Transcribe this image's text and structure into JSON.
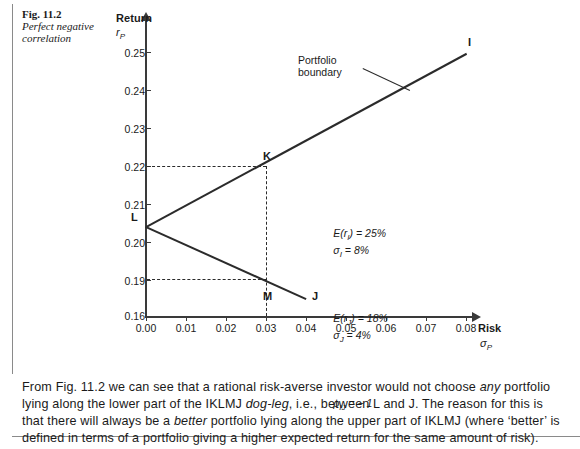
{
  "figure": {
    "number": "Fig. 11.2",
    "title": "Perfect negative correlation"
  },
  "chart_data": {
    "type": "line",
    "title": "",
    "xlabel": "Risk",
    "xlabel_sub": "σP",
    "ylabel": "Return",
    "ylabel_sub": "rP",
    "xlim": [
      0.0,
      0.08
    ],
    "ylim": [
      0.16,
      0.25
    ],
    "xticks": [
      "0.00",
      "0.01",
      "0.02",
      "0.03",
      "0.04",
      "0.05",
      "0.06",
      "0.07",
      "0.08"
    ],
    "yticks": [
      "0.25",
      "0.24",
      "0.23",
      "0.22",
      "0.21",
      "0.20",
      "0.19",
      "0.16"
    ],
    "grid": false,
    "legend": "none",
    "series": [
      {
        "name": "upper-boundary-LKI",
        "points": [
          {
            "label": "L",
            "x": 0.0,
            "y": 0.2035
          },
          {
            "label": "K",
            "x": 0.03,
            "y": 0.2215
          },
          {
            "label": "I",
            "x": 0.08,
            "y": 0.2525
          }
        ]
      },
      {
        "name": "lower-boundary-LMJ",
        "points": [
          {
            "label": "L",
            "x": 0.0,
            "y": 0.2035
          },
          {
            "label": "M",
            "x": 0.03,
            "y": 0.1862
          },
          {
            "label": "J",
            "x": 0.04,
            "y": 0.1765
          }
        ]
      }
    ],
    "point_labels": [
      "I",
      "K",
      "L",
      "M",
      "J"
    ],
    "annotations": [
      {
        "name": "portfolio-boundary",
        "text": "Portfolio boundary",
        "target": "upper-boundary-LKI"
      }
    ],
    "guides": [
      {
        "name": "k-horizontal-dashed",
        "from_axis": "y",
        "value": 0.2215
      },
      {
        "name": "k-vertical-dashed",
        "from_axis": "x",
        "value": 0.03
      },
      {
        "name": "m-horizontal-dashed",
        "from_axis": "y",
        "value": 0.1862
      }
    ],
    "stats": {
      "line1_left": "E(rI) = 25%",
      "line1_right": "σI = 8%",
      "line2_left": "E(rJ) = 18%",
      "line2_right": "σJ = 4%",
      "line3": "ρIJ = − 1"
    }
  },
  "annotation_label": {
    "line1": "Portfolio",
    "line2": "boundary"
  },
  "body": {
    "paragraph_html": "From Fig. 11.2 we can see that a rational risk-averse investor would not choose <i>any</i> portfolio lying along the lower part of the IKLMJ <i>dog-leg</i>, i.e., between L and J. The reason for this is that there will always be a <i>better</i> portfolio lying along the upper part of IKLMJ (where ‘better’ is defined in terms of a portfolio giving a higher expected return for the same amount of risk)."
  }
}
